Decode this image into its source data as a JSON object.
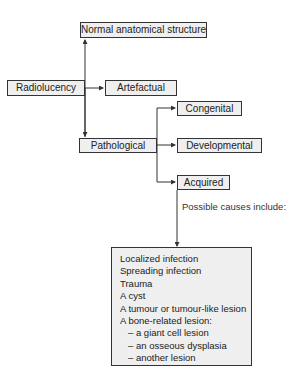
{
  "diagram": {
    "nodes": {
      "normal": "Normal anatomical structure",
      "radiolucency": "Radiolucency",
      "artefactual": "Artefactual",
      "congenital": "Congenital",
      "pathological": "Pathological",
      "developmental": "Developmental",
      "acquired": "Acquired"
    },
    "note": "Possible causes include:",
    "causes": [
      "Localized infection",
      "Spreading infection",
      "Trauma",
      "A cyst",
      "A tumour or tumour-like lesion",
      "A bone-related lesion:"
    ],
    "bone_subtypes": [
      "– a giant cell lesion",
      "– an osseous dysplasia",
      "– another lesion"
    ],
    "colors": {
      "box_fill": "#efefef",
      "line": "#333333"
    }
  }
}
